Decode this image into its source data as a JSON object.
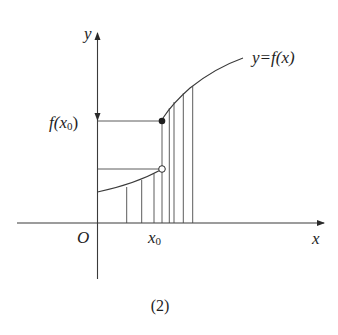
{
  "figure": {
    "caption": "(2)",
    "function_label": "y=f(x)",
    "y_axis_label": "y",
    "x_axis_label": "x",
    "origin_label": "O",
    "x0_label": "x",
    "x0_subscript": "0",
    "fx0_label_prefix": "f(x",
    "fx0_label_sub": "0",
    "fx0_label_suffix": ")"
  },
  "points": {
    "filled_point": {
      "label": "(x0, f(x0))",
      "style": "filled"
    },
    "open_point": {
      "label": "left limit at x0",
      "style": "open"
    }
  },
  "colors": {
    "line": "#3a3a3a",
    "text": "#1e1e1e",
    "background": "#ffffff"
  }
}
